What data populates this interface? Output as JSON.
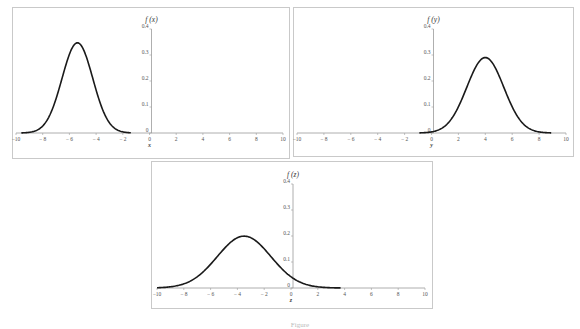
{
  "chart_data": [
    {
      "type": "line",
      "title": "",
      "ylabel": "f (x)",
      "xlabel": "x",
      "xlim": [
        -10,
        10
      ],
      "ylim": [
        0,
        0.4
      ],
      "x_ticks": [
        -10,
        -8,
        -6,
        -4,
        -2,
        0,
        2,
        4,
        6,
        8,
        10
      ],
      "y_ticks": [
        0,
        0.1,
        0.2,
        0.3,
        0.4
      ],
      "grid": false,
      "series": [
        {
          "name": "f(x)",
          "distribution": "normal",
          "mean": -5.4,
          "sd": 1.15,
          "peak": 0.345,
          "x_range": [
            -9.6,
            -1.4
          ]
        }
      ]
    },
    {
      "type": "line",
      "title": "",
      "ylabel": "f (y)",
      "xlabel": "y",
      "xlim": [
        -10,
        10
      ],
      "ylim": [
        0,
        0.4
      ],
      "x_ticks": [
        -10,
        -8,
        -6,
        -4,
        -2,
        0,
        2,
        4,
        6,
        8,
        10
      ],
      "y_ticks": [
        0,
        0.1,
        0.2,
        0.3,
        0.4
      ],
      "grid": false,
      "series": [
        {
          "name": "f(y)",
          "distribution": "normal",
          "mean": 4.0,
          "sd": 1.375,
          "peak": 0.29,
          "x_range": [
            -0.9,
            8.9
          ]
        }
      ]
    },
    {
      "type": "line",
      "title": "",
      "ylabel": "f (z)",
      "xlabel": "z",
      "xlim": [
        -10,
        10
      ],
      "ylim": [
        0,
        0.4
      ],
      "x_ticks": [
        -10,
        -8,
        -6,
        -4,
        -2,
        0,
        2,
        4,
        6,
        8,
        10
      ],
      "y_ticks": [
        0,
        0.1,
        0.2,
        0.3,
        0.4
      ],
      "grid": false,
      "series": [
        {
          "name": "f(z)",
          "distribution": "normal",
          "mean": -3.5,
          "sd": 2.0,
          "peak": 0.2,
          "x_range": [
            -10,
            3.7
          ]
        }
      ]
    }
  ],
  "panels": [
    {
      "ylabel": "f (x)",
      "xlabel": "x"
    },
    {
      "ylabel": "f (y)",
      "xlabel": "y"
    },
    {
      "ylabel": "f (z)",
      "xlabel": "z"
    }
  ],
  "x_tick_labels": [
    "−10",
    "− 8",
    "− 6",
    "− 4",
    "− 2",
    "0",
    "2",
    "4",
    "6",
    "8",
    "10"
  ],
  "y_tick_labels": [
    "0",
    "0.1",
    "0.2",
    "0.3",
    "0.4"
  ],
  "caption": "Figure"
}
